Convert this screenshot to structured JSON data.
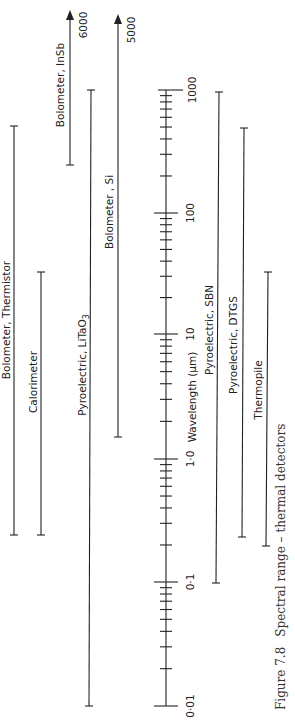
{
  "chart_data": {
    "type": "range-bar",
    "orientation": "rotated-90-ccw",
    "title": "Spectral range – thermal detectors",
    "caption": "Figure 7.8   Spectral range – thermal detectors",
    "xlabel": "Wavelength (µm)",
    "xscale": "log",
    "xlim": [
      0.01,
      1000
    ],
    "tick_labels": [
      "0·01",
      "0·1",
      "1·0",
      "10",
      "100",
      "1000"
    ],
    "tick_values": [
      0.01,
      0.1,
      1.0,
      10,
      100,
      1000
    ],
    "series": [
      {
        "name": "Bolometer, Thermistor",
        "min": 0.24,
        "max": 500,
        "arrow": false
      },
      {
        "name": "Calorimeter",
        "min": 0.24,
        "max": 33,
        "arrow": false
      },
      {
        "name": "Bolometer, InSb",
        "min": 250,
        "max": 6000,
        "arrow": true,
        "max_label": "6000"
      },
      {
        "name": "Pyroelectric, LiTaO3",
        "min": 0.01,
        "max": 1000,
        "arrow": false
      },
      {
        "name": "Bolometer, Si",
        "min": 1.5,
        "max": 5000,
        "arrow": true,
        "max_label": "5000"
      },
      {
        "name": "Pyroelectric, SBN",
        "min": 0.1,
        "max": 1000,
        "arrow": false
      },
      {
        "name": "Pyroelectric, DTGS",
        "min": 0.23,
        "max": 500,
        "arrow": false
      },
      {
        "name": "Thermopile",
        "min": 0.2,
        "max": 33,
        "arrow": false
      }
    ],
    "grid": false,
    "legend": "none (inline labels)"
  },
  "labels": {
    "axis_title": "Wavelength (µm)",
    "tick_001": "0·01",
    "tick_01": "0·1",
    "tick_1": "1·0",
    "tick_10": "10",
    "tick_100": "100",
    "tick_1000": "1000",
    "thermistor": "Bolometer, Thermistor",
    "calorimeter": "Calorimeter",
    "insb": "Bolometer, InSb",
    "insb_max": "6000",
    "litao3_main": "Pyroelectric, LiTaO",
    "litao3_sub": "3",
    "si": "Bolometer , Si",
    "si_max": "5000",
    "sbn": "Pyroelectric, SBN",
    "dtgs": "Pyroelectric, DTGS",
    "thermopile": "Thermopile",
    "caption_fig": "Figure 7.8",
    "caption_text": "Spectral range – thermal detectors"
  }
}
